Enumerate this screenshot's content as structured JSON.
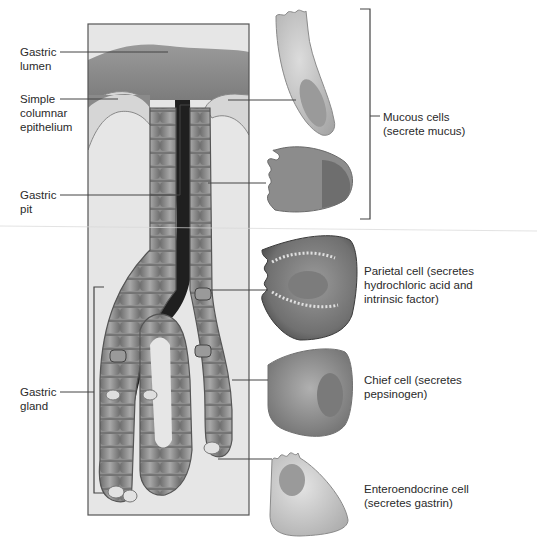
{
  "figure": {
    "labels_left": {
      "gastric_lumen": "Gastric\nlumen",
      "simple_columnar_epithelium": "Simple\ncolumnar\nepithelium",
      "gastric_pit": "Gastric\npit",
      "gastric_gland": "Gastric\ngland"
    },
    "labels_right": {
      "mucous_cells": "Mucous cells\n(secrete mucus)",
      "parietal_cell": "Parietal cell (secretes\nhydrochloric acid and\nintrinsic factor)",
      "chief_cell": "Chief cell (secretes\npepsinogen)",
      "enteroendocrine_cell": "Enteroendocrine cell\n(secretes gastrin)"
    },
    "colors": {
      "frame": "#555555",
      "leader_line": "#444444",
      "lumen": "#8a8a8a",
      "tissue_bg": "#e4e4e4",
      "cell_mid": "#9a9a9a",
      "cell_dark": "#5e5e5e",
      "cell_light": "#d8d8d8",
      "pit_dark": "#1e1e1e"
    }
  }
}
